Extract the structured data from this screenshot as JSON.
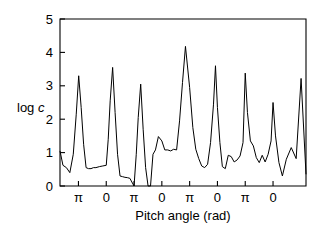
{
  "figure": {
    "background_color": "#ffffff",
    "line_color": "#000000"
  },
  "chart_data": {
    "type": "line",
    "title": "",
    "xlabel": "Pitch angle (rad)",
    "ylabel": "log c",
    "ylabel_parts": {
      "prefix": "log ",
      "italic": "c"
    },
    "xlim": [
      0,
      100
    ],
    "ylim": [
      0,
      5
    ],
    "grid": false,
    "legend": null,
    "yticks": [
      0,
      1,
      2,
      3,
      4,
      5
    ],
    "ytick_labels": [
      "0",
      "1",
      "2",
      "3",
      "4",
      "5"
    ],
    "xticks": [
      7.5,
      18.8,
      30.1,
      41.4,
      52.7,
      64.0,
      75.3,
      86.6
    ],
    "xtick_labels": [
      "π",
      "0",
      "π",
      "0",
      "π",
      "0",
      "π",
      "0"
    ],
    "series": [
      {
        "name": "log c vs pitch angle",
        "x": [
          0.0,
          1.2,
          2.6,
          4.0,
          5.4,
          6.6,
          7.6,
          8.6,
          9.6,
          10.6,
          11.6,
          12.6,
          13.6,
          14.6,
          16.0,
          17.4,
          18.8,
          19.6,
          20.4,
          21.4,
          22.4,
          23.4,
          24.4,
          25.4,
          26.4,
          27.4,
          28.4,
          29.2,
          30.1,
          31.0,
          31.8,
          32.8,
          33.8,
          34.8,
          35.8,
          36.8,
          37.8,
          38.8,
          40.0,
          41.4,
          42.6,
          43.8,
          45.0,
          46.2,
          47.4,
          48.6,
          49.8,
          51.0,
          52.7,
          54.0,
          55.2,
          56.4,
          57.6,
          58.8,
          60.0,
          61.2,
          62.4,
          63.2,
          64.0,
          65.0,
          66.0,
          67.2,
          68.4,
          69.6,
          70.8,
          72.0,
          73.2,
          74.4,
          75.3,
          76.2,
          77.4,
          78.6,
          79.8,
          81.0,
          82.2,
          83.4,
          84.6,
          85.8,
          86.6,
          87.6,
          89.0,
          90.4,
          92.0,
          94.0,
          96.0,
          98.0,
          100.0
        ],
        "y": [
          1.05,
          0.62,
          0.55,
          0.4,
          0.95,
          2.15,
          3.3,
          2.35,
          1.25,
          0.55,
          0.52,
          0.52,
          0.55,
          0.55,
          0.58,
          0.6,
          0.62,
          1.4,
          2.55,
          3.55,
          2.2,
          0.95,
          0.3,
          0.28,
          0.26,
          0.25,
          0.23,
          0.12,
          0.0,
          0.95,
          2.05,
          3.05,
          1.7,
          0.55,
          0.0,
          0.0,
          0.95,
          1.08,
          1.48,
          1.35,
          1.08,
          1.08,
          1.05,
          1.1,
          1.08,
          1.95,
          3.1,
          4.18,
          2.95,
          1.75,
          1.1,
          0.82,
          0.6,
          0.55,
          0.65,
          1.3,
          2.45,
          3.6,
          2.35,
          1.3,
          0.58,
          0.52,
          0.92,
          0.88,
          0.72,
          0.78,
          0.9,
          1.3,
          3.38,
          2.2,
          1.35,
          1.2,
          0.85,
          0.7,
          0.92,
          0.72,
          0.95,
          1.35,
          2.5,
          1.5,
          0.7,
          0.3,
          0.8,
          1.15,
          0.82,
          3.22,
          0.35
        ]
      }
    ],
    "annotations": []
  },
  "axes_geometry": {
    "left_px": 60,
    "right_px": 306,
    "top_px": 19,
    "bottom_px": 186
  }
}
